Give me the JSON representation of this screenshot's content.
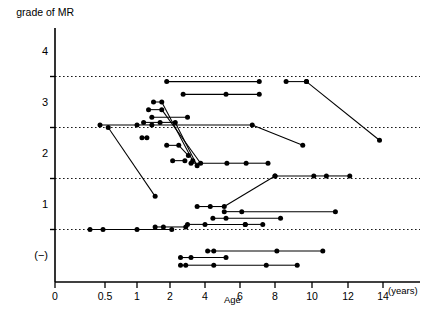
{
  "chart_data": {
    "type": "line",
    "title": "",
    "ylabel": "grade of MR",
    "xlabel": "Age",
    "x_unit": "(years)",
    "y_tick_labels": [
      "4",
      "3",
      "2",
      "1",
      "(−)"
    ],
    "y_tick_values": [
      4,
      3,
      2,
      1,
      0
    ],
    "y_gridline_values": [
      3.5,
      2.5,
      1.5,
      0.5
    ],
    "grid": "dotted horizontal gridlines at half-grades 3.5, 2.5, 1.5, 0.5",
    "legend": "none",
    "x_tick_labels": [
      "0",
      "0.5",
      "1",
      "2",
      "4",
      "6",
      "8",
      "10",
      "12",
      "14"
    ],
    "x_tick_values": [
      0,
      0.5,
      1,
      2,
      4,
      6,
      8,
      10,
      12,
      14
    ],
    "x_axis_note": "non-linear compressed scale below age 2",
    "ylim": [
      -0.45,
      4.35
    ],
    "series": [
      {
        "name": "case-1",
        "points": [
          [
            1.9,
            3.4
          ],
          [
            7.1,
            3.4
          ]
        ]
      },
      {
        "name": "case-2",
        "points": [
          [
            8.6,
            3.4
          ],
          [
            9.7,
            3.4
          ]
        ]
      },
      {
        "name": "case-3",
        "points": [
          [
            9.7,
            3.4
          ],
          [
            13.8,
            2.25
          ]
        ]
      },
      {
        "name": "case-4",
        "points": [
          [
            2.75,
            3.15
          ],
          [
            5.2,
            3.15
          ],
          [
            7.1,
            3.15
          ]
        ]
      },
      {
        "name": "case-5",
        "points": [
          [
            1.5,
            3.0
          ],
          [
            1.75,
            3.0
          ],
          [
            3.3,
            1.85
          ]
        ]
      },
      {
        "name": "case-6",
        "points": [
          [
            1.35,
            2.85
          ],
          [
            1.75,
            2.85
          ],
          [
            3.75,
            1.8
          ]
        ]
      },
      {
        "name": "case-7",
        "points": [
          [
            1.45,
            2.7
          ],
          [
            3.0,
            2.7
          ]
        ]
      },
      {
        "name": "case-8",
        "points": [
          [
            1.2,
            2.6
          ],
          [
            1.7,
            2.6
          ],
          [
            2.3,
            2.6
          ],
          [
            3.55,
            1.75
          ]
        ]
      },
      {
        "name": "case-9",
        "points": [
          [
            0.45,
            2.55
          ],
          [
            1.0,
            2.55
          ],
          [
            1.45,
            2.55
          ],
          [
            6.7,
            2.55
          ],
          [
            9.5,
            2.15
          ]
        ]
      },
      {
        "name": "case-10",
        "points": [
          [
            0.55,
            2.5
          ],
          [
            1.55,
            1.15
          ]
        ]
      },
      {
        "name": "case-11",
        "points": [
          [
            1.15,
            2.3
          ],
          [
            1.3,
            2.3
          ]
        ]
      },
      {
        "name": "case-12",
        "points": [
          [
            1.9,
            2.15
          ],
          [
            2.5,
            2.15
          ],
          [
            3.05,
            1.95
          ]
        ]
      },
      {
        "name": "case-13",
        "points": [
          [
            2.15,
            1.85
          ],
          [
            2.85,
            1.85
          ]
        ]
      },
      {
        "name": "case-14",
        "points": [
          [
            3.2,
            1.8
          ],
          [
            5.25,
            1.8
          ],
          [
            6.35,
            1.8
          ],
          [
            7.6,
            1.8
          ]
        ]
      },
      {
        "name": "case-15",
        "points": [
          [
            3.55,
            0.95
          ],
          [
            4.3,
            0.95
          ],
          [
            5.1,
            0.95
          ],
          [
            8.0,
            1.55
          ]
        ]
      },
      {
        "name": "case-16",
        "points": [
          [
            5.1,
            0.85
          ],
          [
            6.1,
            0.85
          ],
          [
            11.3,
            0.85
          ]
        ]
      },
      {
        "name": "case-17",
        "points": [
          [
            4.45,
            0.72
          ],
          [
            5.2,
            0.72
          ],
          [
            8.3,
            0.72
          ]
        ]
      },
      {
        "name": "case-18",
        "points": [
          [
            8.0,
            1.55
          ],
          [
            10.1,
            1.55
          ],
          [
            10.8,
            1.55
          ],
          [
            12.1,
            1.55
          ]
        ]
      },
      {
        "name": "case-19",
        "points": [
          [
            0.35,
            0.5
          ],
          [
            0.48,
            0.5
          ],
          [
            1.0,
            0.5
          ],
          [
            2.1,
            0.5
          ]
        ]
      },
      {
        "name": "case-20",
        "points": [
          [
            1.55,
            0.55
          ],
          [
            1.8,
            0.55
          ],
          [
            2.9,
            0.55
          ]
        ]
      },
      {
        "name": "case-21",
        "points": [
          [
            3.0,
            0.6
          ],
          [
            4.0,
            0.6
          ],
          [
            6.3,
            0.6
          ]
        ]
      },
      {
        "name": "case-22",
        "points": [
          [
            6.3,
            0.6
          ],
          [
            7.3,
            0.6
          ]
        ]
      },
      {
        "name": "case-23",
        "points": [
          [
            4.15,
            0.08
          ],
          [
            4.5,
            0.08
          ],
          [
            8.1,
            0.08
          ],
          [
            10.6,
            0.08
          ]
        ]
      },
      {
        "name": "case-24",
        "points": [
          [
            2.6,
            -0.05
          ],
          [
            3.2,
            -0.05
          ],
          [
            5.2,
            -0.05
          ]
        ]
      },
      {
        "name": "case-25",
        "points": [
          [
            2.6,
            -0.2
          ],
          [
            2.9,
            -0.2
          ],
          [
            4.5,
            -0.2
          ],
          [
            7.5,
            -0.2
          ],
          [
            9.2,
            -0.2
          ]
        ]
      }
    ]
  }
}
